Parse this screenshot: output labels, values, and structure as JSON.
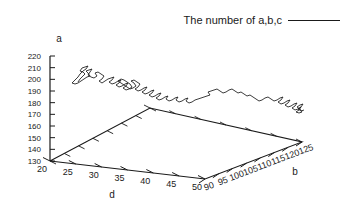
{
  "figure": {
    "background": "#ffffff",
    "ink": "#1a1a1a",
    "width": 349,
    "height": 216
  },
  "legend": {
    "label": "The number of a,b,c",
    "line_sample": "solid-line",
    "position": "top-right"
  },
  "axes": {
    "z": {
      "label": "a",
      "ticks": [
        130,
        140,
        150,
        160,
        170,
        180,
        190,
        200,
        210,
        220
      ],
      "tick_labels": [
        "130",
        "140",
        "150",
        "160",
        "170",
        "180",
        "190",
        "200",
        "210",
        "220"
      ],
      "min": 130,
      "max": 220
    },
    "x": {
      "label": "d",
      "ticks": [
        20,
        25,
        30,
        35,
        40,
        45,
        50
      ],
      "tick_labels": [
        "20",
        "25",
        "30",
        "35",
        "40",
        "45",
        "50"
      ],
      "min": 20,
      "max": 50
    },
    "y": {
      "label": "b",
      "ticks": [
        90,
        95,
        100,
        105,
        110,
        115,
        120,
        125
      ],
      "tick_labels": [
        "90",
        "95",
        "100",
        "105",
        "110",
        "115",
        "120",
        "125"
      ],
      "min": 90,
      "max": 125
    }
  },
  "chart_data": {
    "type": "line",
    "title": "",
    "subtitle": "",
    "xlabel": "d",
    "ylabel": "b",
    "zlabel": "a",
    "xlim": [
      20,
      50
    ],
    "ylim": [
      90,
      125
    ],
    "zlim": [
      130,
      220
    ],
    "grid": false,
    "legend_position": "top-right",
    "projection": "3d",
    "series": [
      {
        "name": "The number of a,b,c",
        "color": "#1a1a1a",
        "style": "solid-line",
        "comment": "Single noisy 3-D trajectory descending from upper-left (low d, low b, high a) to lower-right (high d, high b, low a). Points given as screen-space polyline of the rendered projection.",
        "screen_points": [
          [
            78,
            82
          ],
          [
            80,
            79
          ],
          [
            83,
            76
          ],
          [
            85,
            74
          ],
          [
            83,
            72
          ],
          [
            80,
            71
          ],
          [
            82,
            68
          ],
          [
            85,
            67
          ],
          [
            88,
            66
          ],
          [
            86,
            69
          ],
          [
            83,
            71
          ],
          [
            80,
            74
          ],
          [
            78,
            77
          ],
          [
            76,
            79
          ],
          [
            74,
            81
          ],
          [
            72,
            83
          ],
          [
            75,
            84
          ],
          [
            78,
            83
          ],
          [
            81,
            81
          ],
          [
            84,
            79
          ],
          [
            87,
            77
          ],
          [
            90,
            76
          ],
          [
            88,
            73
          ],
          [
            86,
            71
          ],
          [
            89,
            70
          ],
          [
            92,
            69
          ],
          [
            90,
            72
          ],
          [
            88,
            75
          ],
          [
            91,
            77
          ],
          [
            94,
            78
          ],
          [
            97,
            76
          ],
          [
            95,
            73
          ],
          [
            98,
            72
          ],
          [
            101,
            74
          ],
          [
            104,
            76
          ],
          [
            102,
            79
          ],
          [
            99,
            81
          ],
          [
            102,
            83
          ],
          [
            105,
            81
          ],
          [
            108,
            79
          ],
          [
            111,
            78
          ],
          [
            114,
            77
          ],
          [
            112,
            80
          ],
          [
            109,
            82
          ],
          [
            112,
            84
          ],
          [
            115,
            83
          ],
          [
            118,
            81
          ],
          [
            121,
            80
          ],
          [
            119,
            83
          ],
          [
            116,
            85
          ],
          [
            119,
            87
          ],
          [
            122,
            86
          ],
          [
            125,
            84
          ],
          [
            128,
            83
          ],
          [
            126,
            86
          ],
          [
            123,
            88
          ],
          [
            126,
            90
          ],
          [
            129,
            89
          ],
          [
            132,
            87
          ],
          [
            130,
            84
          ],
          [
            127,
            82
          ],
          [
            124,
            80
          ],
          [
            121,
            79
          ],
          [
            118,
            81
          ],
          [
            121,
            83
          ],
          [
            124,
            85
          ],
          [
            127,
            87
          ],
          [
            130,
            89
          ],
          [
            133,
            88
          ],
          [
            136,
            86
          ],
          [
            134,
            83
          ],
          [
            131,
            81
          ],
          [
            134,
            80
          ],
          [
            137,
            82
          ],
          [
            140,
            84
          ],
          [
            138,
            87
          ],
          [
            135,
            89
          ],
          [
            138,
            91
          ],
          [
            141,
            90
          ],
          [
            144,
            88
          ],
          [
            147,
            87
          ],
          [
            145,
            90
          ],
          [
            142,
            92
          ],
          [
            145,
            94
          ],
          [
            148,
            93
          ],
          [
            151,
            91
          ],
          [
            154,
            90
          ],
          [
            152,
            93
          ],
          [
            149,
            95
          ],
          [
            152,
            97
          ],
          [
            155,
            96
          ],
          [
            158,
            94
          ],
          [
            161,
            93
          ],
          [
            159,
            96
          ],
          [
            156,
            98
          ],
          [
            159,
            100
          ],
          [
            162,
            99
          ],
          [
            165,
            97
          ],
          [
            168,
            96
          ],
          [
            166,
            99
          ],
          [
            169,
            101
          ],
          [
            172,
            100
          ],
          [
            175,
            98
          ],
          [
            178,
            97
          ],
          [
            176,
            100
          ],
          [
            179,
            102
          ],
          [
            182,
            101
          ],
          [
            185,
            99
          ],
          [
            188,
            98
          ],
          [
            186,
            101
          ],
          [
            189,
            103
          ],
          [
            192,
            102
          ],
          [
            195,
            100
          ],
          [
            198,
            99
          ],
          [
            201,
            98
          ],
          [
            204,
            97
          ],
          [
            207,
            96
          ],
          [
            210,
            95
          ],
          [
            208,
            92
          ],
          [
            211,
            91
          ],
          [
            214,
            90
          ],
          [
            217,
            89
          ],
          [
            220,
            91
          ],
          [
            223,
            93
          ],
          [
            226,
            92
          ],
          [
            229,
            90
          ],
          [
            232,
            89
          ],
          [
            235,
            91
          ],
          [
            238,
            93
          ],
          [
            241,
            92
          ],
          [
            244,
            94
          ],
          [
            247,
            96
          ],
          [
            250,
            95
          ],
          [
            253,
            97
          ],
          [
            256,
            99
          ],
          [
            259,
            101
          ],
          [
            262,
            100
          ],
          [
            265,
            98
          ],
          [
            268,
            97
          ],
          [
            271,
            99
          ],
          [
            274,
            101
          ],
          [
            277,
            100
          ],
          [
            280,
            98
          ],
          [
            283,
            97
          ],
          [
            281,
            100
          ],
          [
            278,
            102
          ],
          [
            281,
            104
          ],
          [
            284,
            103
          ],
          [
            287,
            101
          ],
          [
            290,
            100
          ],
          [
            288,
            103
          ],
          [
            285,
            105
          ],
          [
            288,
            107
          ],
          [
            291,
            106
          ],
          [
            294,
            104
          ],
          [
            297,
            103
          ],
          [
            295,
            106
          ],
          [
            292,
            108
          ],
          [
            295,
            110
          ],
          [
            298,
            109
          ],
          [
            301,
            107
          ],
          [
            299,
            110
          ],
          [
            296,
            112
          ],
          [
            299,
            113
          ],
          [
            302,
            112
          ],
          [
            300,
            109
          ],
          [
            297,
            107
          ],
          [
            300,
            105
          ],
          [
            303,
            104
          ],
          [
            301,
            107
          ],
          [
            298,
            109
          ],
          [
            301,
            111
          ],
          [
            304,
            110
          ]
        ]
      }
    ]
  },
  "geometry": {
    "comment": "Screen-space anchors of the gnuplot 3-D box floor (parallelogram) and the vertical z axis.",
    "floor": {
      "origin_d20_b90": [
        50,
        161
      ],
      "back_d20_b125": [
        150,
        108
      ],
      "right_d50_b125": [
        302,
        142
      ],
      "front_d50_b90": [
        205,
        179
      ]
    },
    "z_axis": {
      "bottom": [
        50,
        161
      ],
      "top": [
        50,
        56
      ]
    }
  }
}
